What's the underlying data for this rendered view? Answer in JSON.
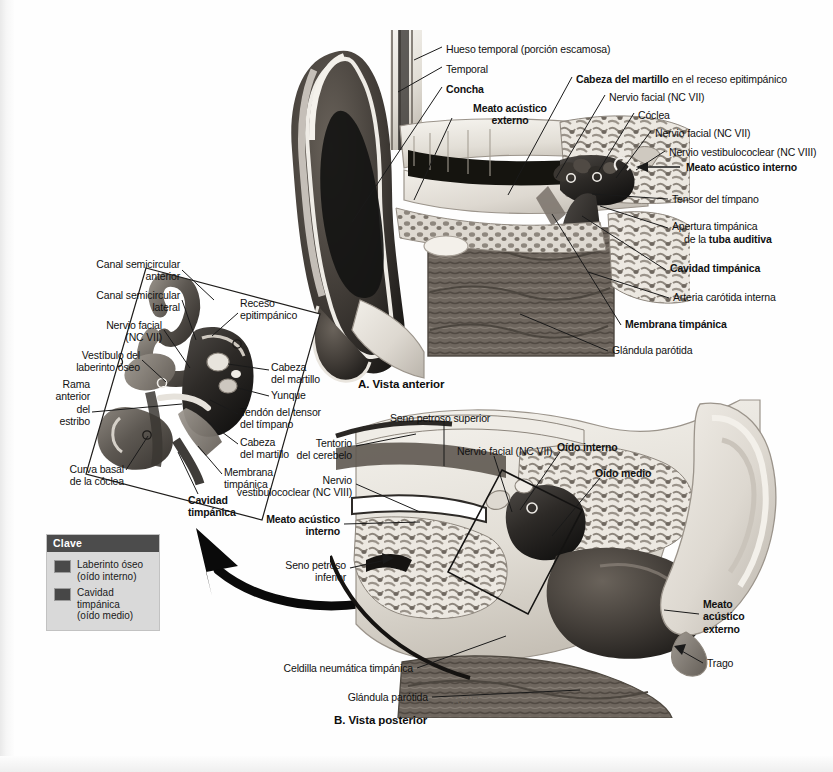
{
  "page": {
    "background": "#fefefe",
    "ink": "#111111"
  },
  "panel_a": {
    "caption": "A. Vista anterior",
    "labels": [
      {
        "id": "hueso-temporal",
        "text": "Hueso temporal (porción escamosa)",
        "bold": false,
        "align": "left",
        "x": 446,
        "y": 43
      },
      {
        "id": "temporal",
        "text": "Temporal",
        "bold": false,
        "align": "left",
        "x": 446,
        "y": 63
      },
      {
        "id": "concha",
        "text": "Concha",
        "bold": true,
        "align": "left",
        "x": 446,
        "y": 83
      },
      {
        "id": "meato-acustico-externo",
        "text": "Meato acústico\nexterno",
        "bold": true,
        "align": "left",
        "x": 455,
        "y": 107
      },
      {
        "id": "cabeza-martillo-receso",
        "text": "Cabeza del martillo en el receso epitimpánico",
        "bold": "mixed",
        "bold_prefix": "Cabeza del martillo",
        "rest": " en el receso epitimpánico",
        "align": "left",
        "x": 576,
        "y": 73
      },
      {
        "id": "nervio-facial-1",
        "text": "Nervio facial (NC VII)",
        "bold": false,
        "align": "left",
        "x": 609,
        "y": 91
      },
      {
        "id": "coclea",
        "text": "Cóclea",
        "bold": false,
        "align": "left",
        "x": 638,
        "y": 109
      },
      {
        "id": "nervio-facial-2",
        "text": "Nervio facial (NC VII)",
        "bold": false,
        "align": "left",
        "x": 655,
        "y": 127
      },
      {
        "id": "nervio-vestibulococlear",
        "text": "Nervio vestibulococlear (NC VIII)",
        "bold": false,
        "align": "left",
        "x": 669,
        "y": 147
      },
      {
        "id": "meato-acustico-interno",
        "text": "Meato acústico interno",
        "bold": true,
        "align": "left",
        "x": 684,
        "y": 164
      },
      {
        "id": "tensor-timpano",
        "text": "Tensor del tímpano",
        "bold": false,
        "align": "left",
        "x": 672,
        "y": 196
      },
      {
        "id": "apertura-timpanica",
        "text": "Apertura timpánica",
        "bold": false,
        "align": "left",
        "x": 672,
        "y": 223
      },
      {
        "id": "tuba-auditiva",
        "text": "de la tuba auditiva",
        "bold": "mixed",
        "bold_prefix": "de la ",
        "rest": "tuba auditiva",
        "align": "left",
        "x": 684,
        "y": 236
      },
      {
        "id": "cavidad-timpanica-a",
        "text": "Cavidad timpánica",
        "bold": true,
        "align": "left",
        "x": 670,
        "y": 266
      },
      {
        "id": "arteria-carotida",
        "text": "Arteria carótida interna",
        "bold": false,
        "align": "left",
        "x": 673,
        "y": 294
      },
      {
        "id": "membrana-timpanica-a",
        "text": "Membrana timpánica",
        "bold": true,
        "align": "left",
        "x": 625,
        "y": 321
      },
      {
        "id": "glandula-parotida-a",
        "text": "Glándula parótida",
        "bold": false,
        "align": "left",
        "x": 612,
        "y": 347
      }
    ]
  },
  "inset": {
    "labels": [
      {
        "id": "canal-semicircular-anterior",
        "text": "Canal semicircular\nanterior",
        "bold": false,
        "align": "right",
        "x": 178,
        "y": 260
      },
      {
        "id": "canal-semicircular-lateral",
        "text": "Canal semicircular\nlateral",
        "bold": false,
        "align": "right",
        "x": 178,
        "y": 291
      },
      {
        "id": "nervio-facial-inset",
        "text": "Nervio facial\n(NC VII)",
        "bold": false,
        "align": "right",
        "x": 160,
        "y": 321
      },
      {
        "id": "vestibulo-laberinto",
        "text": "Vestíbulo del\nlaberinto óseo",
        "bold": false,
        "align": "right",
        "x": 138,
        "y": 352
      },
      {
        "id": "rama-anterior-estribo",
        "text": "Rama\nanterior\ndel\nestribo",
        "bold": false,
        "align": "right",
        "x": 88,
        "y": 381
      },
      {
        "id": "curva-basal-coclea",
        "text": "Curva basal\nde la cóclea",
        "bold": false,
        "align": "right",
        "x": 122,
        "y": 466
      },
      {
        "id": "receso-epitimpanico",
        "text": "Receso\nepitimpánico",
        "bold": false,
        "align": "left",
        "x": 240,
        "y": 300
      },
      {
        "id": "cabeza-martillo-1",
        "text": "Cabeza\ndel martillo",
        "bold": false,
        "align": "left",
        "x": 271,
        "y": 363
      },
      {
        "id": "yunque",
        "text": "Yunque",
        "bold": false,
        "align": "left",
        "x": 271,
        "y": 392
      },
      {
        "id": "tendon-tensor-timpano",
        "text": "Tendón del tensor\ndel tímpano",
        "bold": false,
        "align": "left",
        "x": 240,
        "y": 408
      },
      {
        "id": "cabeza-martillo-2",
        "text": "Cabeza\ndel martillo",
        "bold": false,
        "align": "left",
        "x": 240,
        "y": 438
      },
      {
        "id": "membrana-timpanica-inset",
        "text": "Membrana\ntimpánica",
        "bold": false,
        "align": "left",
        "x": 224,
        "y": 468
      },
      {
        "id": "cavidad-timpanica-inset",
        "text": "Cavidad\ntimpánica",
        "bold": true,
        "align": "left",
        "x": 188,
        "y": 496
      }
    ]
  },
  "panel_b": {
    "caption": "B. Vista posterior",
    "labels": [
      {
        "id": "seno-petroso-superior",
        "text": "Seno petroso superior",
        "bold": false,
        "align": "left",
        "x": 390,
        "y": 415
      },
      {
        "id": "tentorio-cerebelo",
        "text": "Tentorio\ndel cerebelo",
        "bold": false,
        "align": "right",
        "x": 352,
        "y": 440
      },
      {
        "id": "nervio-facial-b",
        "text": "Nervio facial (NC VII)",
        "bold": false,
        "align": "left",
        "x": 457,
        "y": 448
      },
      {
        "id": "oido-interno",
        "text": "Oído interno",
        "bold": true,
        "align": "left",
        "x": 557,
        "y": 444
      },
      {
        "id": "oido-medio",
        "text": "Oído medio",
        "bold": true,
        "align": "left",
        "x": 595,
        "y": 470
      },
      {
        "id": "nervio-vestibulococlear-b",
        "text": "Nervio\nvestibulococlear (NC VIII)",
        "bold": false,
        "align": "right",
        "x": 352,
        "y": 477
      },
      {
        "id": "meato-acustico-interno-b",
        "text": "Meato acústico\ninterno",
        "bold": true,
        "align": "right",
        "x": 340,
        "y": 516
      },
      {
        "id": "seno-petroso-inferior",
        "text": "Seno petroso\ninferior",
        "bold": false,
        "align": "right",
        "x": 346,
        "y": 562
      },
      {
        "id": "meato-acustico-externo-b",
        "text": "Meato\nacústico\nexterno",
        "bold": true,
        "align": "left",
        "x": 703,
        "y": 600
      },
      {
        "id": "trago",
        "text": "Trago",
        "bold": false,
        "align": "left",
        "x": 707,
        "y": 660
      },
      {
        "id": "celdilla-neumatica",
        "text": "Celdilla neumática timpánica",
        "bold": false,
        "align": "right",
        "x": 413,
        "y": 665
      },
      {
        "id": "glandula-parotida-b",
        "text": "Glándula parótida",
        "bold": false,
        "align": "right",
        "x": 428,
        "y": 694
      }
    ]
  },
  "key": {
    "header": "Clave",
    "items": [
      {
        "id": "laberinto-oseo",
        "swatch": "#4a4a4a",
        "label": "Laberinto óseo\n(oído interno)"
      },
      {
        "id": "cavidad-timpanica",
        "swatch": "#474747",
        "label": "Cavidad timpánica\n(oído medio)"
      }
    ]
  },
  "colors": {
    "ink": "#111111",
    "leader": "#1a1a1a",
    "key_box_bg": "#d9d9d9",
    "key_header_bg": "#4c4c4c",
    "arrow": "#0a0a0a"
  }
}
